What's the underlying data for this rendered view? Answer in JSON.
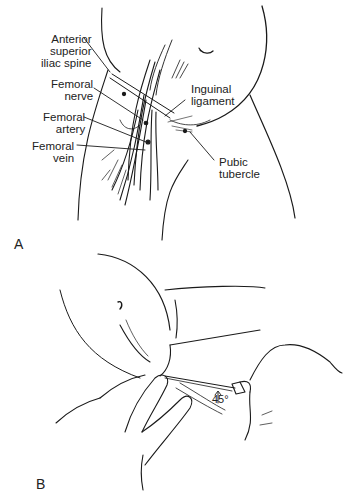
{
  "figure": {
    "panels": [
      {
        "id": "A",
        "letter": "A",
        "description": "Anatomy of the femoral region showing inguinal ligament and femoral neurovascular bundle",
        "labels": {
          "asis_1": "Anterior",
          "asis_2": "superior",
          "asis_3": "iliac spine",
          "nerve_1": "Femoral",
          "nerve_2": "nerve",
          "artery_1": "Femoral",
          "artery_2": "artery",
          "vein_1": "Femoral",
          "vein_2": "vein",
          "ligament_1": "Inguinal",
          "ligament_2": "ligament",
          "pubic_1": "Pubic",
          "pubic_2": "tubercle"
        }
      },
      {
        "id": "B",
        "letter": "B",
        "description": "Needle insertion into femoral vessel at 45 degree angle while palpating with fingers",
        "angle_label": "45°"
      }
    ]
  }
}
